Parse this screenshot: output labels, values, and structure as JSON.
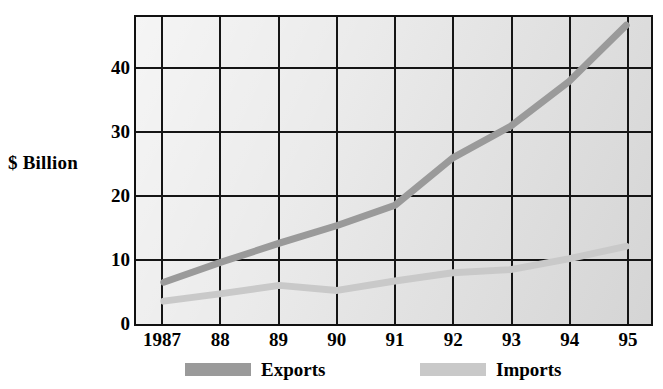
{
  "chart_data": {
    "type": "line",
    "title": "",
    "xlabel": "",
    "ylabel": "$ Billion",
    "categories": [
      "1987",
      "88",
      "89",
      "90",
      "91",
      "92",
      "93",
      "94",
      "95"
    ],
    "x_tick_labels": [
      "1987",
      "88",
      "89",
      "90",
      "91",
      "92",
      "93",
      "94",
      "95"
    ],
    "y_tick_labels": [
      "0",
      "10",
      "20",
      "30",
      "40"
    ],
    "y_ticks": [
      0,
      10,
      20,
      30,
      40
    ],
    "ylim": [
      0,
      48
    ],
    "xlim": [
      1987,
      1995
    ],
    "grid": true,
    "legend_position": "bottom",
    "series": [
      {
        "name": "Exports",
        "color": "#9a9a9a",
        "values": [
          6.3,
          9.5,
          12.5,
          15.3,
          18.5,
          26.0,
          31.0,
          38.0,
          47.0
        ]
      },
      {
        "name": "Imports",
        "color": "#c9c9c9",
        "values": [
          3.3,
          4.5,
          5.8,
          5.0,
          6.5,
          7.8,
          8.3,
          10.0,
          12.0
        ]
      }
    ]
  },
  "axis": {
    "y_title": "$ Billion"
  },
  "legend": {
    "items": [
      {
        "label": "Exports",
        "color": "#9a9a9a"
      },
      {
        "label": "Imports",
        "color": "#c9c9c9"
      }
    ]
  },
  "colors": {
    "plot_background": "#e9e9e9",
    "axis_line": "#151515",
    "exports_series": "#9a9a9a",
    "imports_series": "#c9c9c9",
    "text": "#000000",
    "page_background": "#ffffff"
  }
}
